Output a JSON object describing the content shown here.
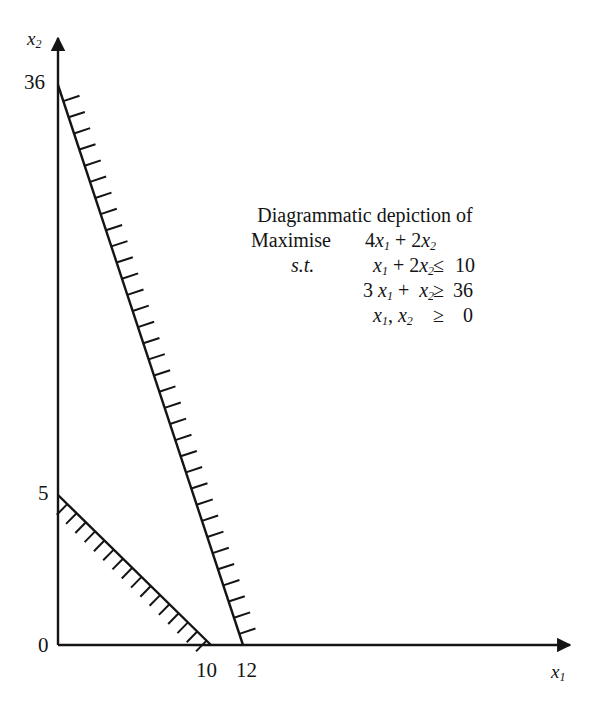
{
  "figure": {
    "kind": "linear-programming-feasible-region-diagram",
    "background_color": "#ffffff",
    "line_color": "#141414",
    "axes": {
      "x_axis_label": "x",
      "x_axis_label_sub": "1",
      "y_axis_label": "x",
      "y_axis_label_sub": "2",
      "origin_label": "0"
    },
    "y_ticks": [
      "36",
      "5"
    ],
    "x_ticks": [
      "10",
      "12"
    ]
  },
  "caption": {
    "title": "Diagrammatic depiction of",
    "objective_word": "Maximise",
    "objective_expr": "4x₁ + 2x₂",
    "st_label": "s.t.",
    "constraints": [
      {
        "lhs": "x₁ + 2x₂",
        "rel": "≤",
        "rhs": "10"
      },
      {
        "lhs": "3x₁ +  x₂",
        "rel": "≥",
        "rhs": "36"
      },
      {
        "lhs": "x₁, x₂",
        "rel": "≥",
        "rhs": "0"
      }
    ],
    "obj_coef_1": "4",
    "obj_coef_2": "2",
    "c1_coef_1": "",
    "c1_coef_2": "2",
    "c1_rhs": "10",
    "c1_rel": "≤",
    "c2_coef_1": "3",
    "c2_coef_2": "",
    "c2_rhs": "36",
    "c2_rel": "≥",
    "c3_rhs": "0",
    "c3_rel": "≥"
  },
  "chart_data": {
    "type": "line",
    "title": "Diagrammatic depiction of",
    "xlabel": "x1",
    "ylabel": "x2",
    "xlim": [
      0,
      36
    ],
    "ylim": [
      0,
      40
    ],
    "grid": false,
    "legend": "none",
    "xticks": [
      10,
      12
    ],
    "yticks": [
      0,
      5,
      36
    ],
    "series": [
      {
        "name": "3x1 + x2 = 36",
        "points": [
          [
            0,
            36
          ],
          [
            12,
            0
          ]
        ],
        "hatch_side": "right",
        "inequality": "3x1 + x2 >= 36"
      },
      {
        "name": "x1 + 2x2 = 10",
        "points": [
          [
            0,
            5
          ],
          [
            10,
            0
          ]
        ],
        "hatch_side": "lower-left",
        "inequality": "x1 + 2x2 <= 10"
      }
    ],
    "annotations": [
      "Maximise 4x1 + 2x2",
      "s.t. x1 + 2x2 <= 10",
      "3x1 + x2 >= 36",
      "x1, x2 >= 0"
    ]
  }
}
